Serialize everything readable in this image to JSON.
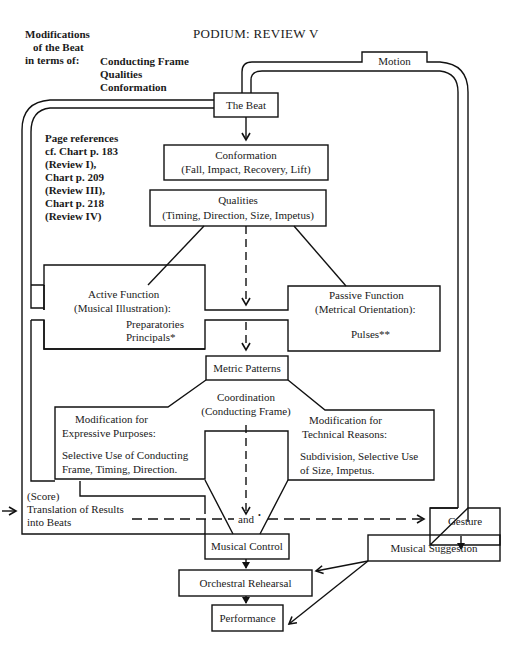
{
  "title": "PODIUM:  REVIEW V",
  "header_left": {
    "line1": "Modifications",
    "line2": "of the Beat",
    "line3": "in terms of:",
    "items": [
      "Conducting Frame",
      "Qualities",
      "Conformation"
    ]
  },
  "page_references": [
    "Page references",
    "cf. Chart p. 183",
    "(Review I),",
    "Chart p. 209",
    "(Review III),",
    "Chart p. 218",
    "(Review IV)"
  ],
  "nodes": {
    "motion": "Motion",
    "the_beat": "The Beat",
    "conformation": {
      "title": "Conformation",
      "detail": "(Fall, Impact, Recovery, Lift)"
    },
    "qualities": {
      "title": "Qualities",
      "detail": "(Timing, Direction, Size, Impetus)"
    },
    "active_function": {
      "title": "Active Function",
      "subtitle": "(Musical Illustration):",
      "items": [
        "Preparatories",
        "Principals*"
      ]
    },
    "passive_function": {
      "title": "Passive Function",
      "subtitle": "(Metrical Orientation):",
      "items": [
        "Pulses**"
      ]
    },
    "metric_patterns": "Metric Patterns",
    "coordination": {
      "title": "Coordination",
      "subtitle": "(Conducting Frame)"
    },
    "mod_expressive": {
      "title": "Modification for",
      "subtitle": "Expressive Purposes:",
      "body1": "Selective Use  of Conducting",
      "body2": "Frame, Timing,   Direction."
    },
    "mod_technical": {
      "title": "Modification for",
      "subtitle": "Technical Reasons:",
      "body1": "Subdivision,  Selective Use",
      "body2": "of Size,  Impetus."
    },
    "score": {
      "label": "(Score)",
      "line1": "Translation of Results",
      "line2": "into Beats"
    },
    "and": "and",
    "and_mark": "•",
    "gesture": "Gesture",
    "musical_control": "Musical Control",
    "musical_suggestion": "Musical Suggestion",
    "orchestral_rehearsal": "Orchestral Rehearsal",
    "performance": "Performance"
  }
}
